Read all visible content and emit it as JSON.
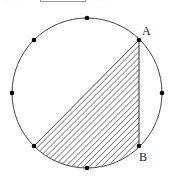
{
  "header": {
    "left_text": "·····",
    "blank_box": "",
    "right_text": "·····"
  },
  "figure": {
    "circle": {
      "cx": 87,
      "cy": 93,
      "r": 75,
      "stroke": "#444444"
    },
    "points": [
      {
        "name": "top",
        "x": 87,
        "y": 18
      },
      {
        "name": "upper-right",
        "label": "A",
        "x": 139,
        "y": 40
      },
      {
        "name": "right",
        "x": 162,
        "y": 93
      },
      {
        "name": "lower-right",
        "label": "B",
        "x": 139,
        "y": 146
      },
      {
        "name": "bottom",
        "x": 87,
        "y": 168
      },
      {
        "name": "lower-left",
        "x": 34,
        "y": 146
      },
      {
        "name": "left",
        "x": 12,
        "y": 93
      },
      {
        "name": "upper-left",
        "x": 34,
        "y": 40
      }
    ],
    "labels": {
      "A": "A",
      "B": "B"
    },
    "shaded_region": "segment bounded by chord from lower-left point to A, segment AB, and arc from B through bottom back to lower-left point",
    "hatch_color": "#333333"
  }
}
